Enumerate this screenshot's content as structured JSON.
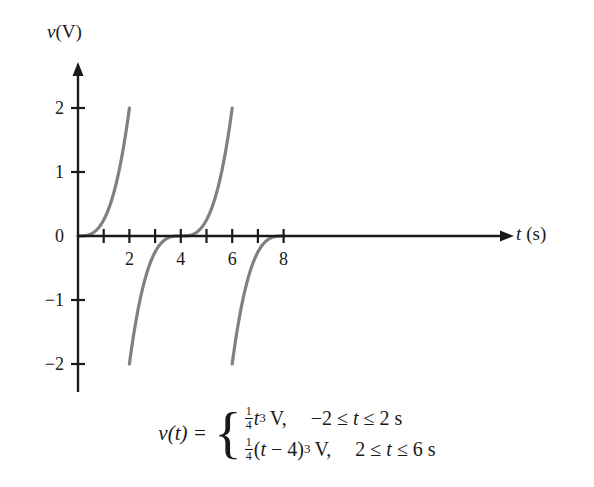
{
  "chart_data": {
    "type": "line",
    "title": "",
    "xlabel": "t (s)",
    "ylabel": "v(V)",
    "xlim": [
      0,
      8.6
    ],
    "ylim": [
      -2.6,
      2.6
    ],
    "grid": false,
    "legend": "none",
    "line_color": "#808080",
    "axis_color": "#1a1a1a",
    "x_ticks": [
      1,
      2,
      3,
      4,
      5,
      6,
      7,
      8
    ],
    "x_tick_labels": [
      "",
      "2",
      "",
      "4",
      "",
      "6",
      "",
      "8"
    ],
    "y_ticks": [
      -2,
      -1,
      0,
      1,
      2
    ],
    "y_tick_labels": [
      "−2",
      "−1",
      "0",
      "1",
      "2"
    ],
    "series": [
      {
        "name": "v(t) segment 1",
        "formula": "0.25 * t^3",
        "x_range": [
          0,
          2
        ],
        "endpoints": [
          [
            0,
            0
          ],
          [
            2,
            2
          ]
        ]
      },
      {
        "name": "v(t) segment 2",
        "formula": "0.25 * (t - 4)^3",
        "x_range": [
          2,
          6
        ],
        "endpoints": [
          [
            2,
            -2
          ],
          [
            6,
            2
          ]
        ]
      },
      {
        "name": "v(t) segment 3",
        "formula": "0.25 * (t - 8)^3",
        "x_range": [
          6,
          8
        ],
        "endpoints": [
          [
            6,
            -2
          ],
          [
            8,
            0
          ]
        ]
      }
    ],
    "discontinuities": [
      {
        "t": 2,
        "from": 2,
        "to": -2
      },
      {
        "t": 6,
        "from": 2,
        "to": -2
      }
    ]
  },
  "axes": {
    "y_label_var": "v",
    "y_label_unit": "(V)",
    "x_label_var": "t",
    "x_label_unit": "(s)"
  },
  "tick_labels": {
    "y": [
      {
        "value": 2,
        "text": "2"
      },
      {
        "value": 1,
        "text": "1"
      },
      {
        "value": 0,
        "text": "0"
      },
      {
        "value": -1,
        "text": "−1"
      },
      {
        "value": -2,
        "text": "−2"
      }
    ],
    "x": [
      {
        "value": 2,
        "text": "2"
      },
      {
        "value": 4,
        "text": "4"
      },
      {
        "value": 6,
        "text": "6"
      },
      {
        "value": 8,
        "text": "8"
      }
    ]
  },
  "equation": {
    "lhs_var": "v",
    "lhs_rest": "(t) =",
    "row1": {
      "frac_num": "1",
      "frac_den": "4",
      "base": "t",
      "exponent": "3",
      "unit": "V,",
      "cond_left": "−2 ≤",
      "cond_var": "t",
      "cond_right": "≤ 2 s"
    },
    "row2": {
      "frac_num": "1",
      "frac_den": "4",
      "open": "(",
      "base": "t",
      "minus": "− 4)",
      "exponent": "3",
      "unit": "V,",
      "cond_left": "2 ≤",
      "cond_var": "t",
      "cond_right": "≤ 6 s"
    }
  }
}
